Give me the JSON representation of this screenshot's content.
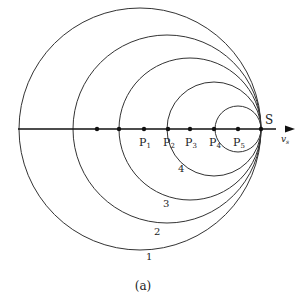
{
  "diagram": {
    "caption": "(a)",
    "source_label": "S",
    "velocity_label": "v",
    "velocity_subscript": "s",
    "axis_y": 129,
    "source_x": 261,
    "circles": [
      {
        "label": "1",
        "cx": 140,
        "r": 121,
        "label_x": 146,
        "label_y": 260
      },
      {
        "label": "2",
        "cx": 167,
        "r": 94,
        "label_x": 154,
        "label_y": 235
      },
      {
        "label": "3",
        "cx": 190,
        "r": 71,
        "label_x": 163,
        "label_y": 207
      },
      {
        "label": "4",
        "cx": 214,
        "r": 47,
        "label_x": 178,
        "label_y": 172
      },
      {
        "label": "5",
        "cx": 238,
        "r": 23
      }
    ],
    "points": [
      {
        "x": 97,
        "label": ""
      },
      {
        "x": 119,
        "label": ""
      },
      {
        "x": 144,
        "label": "P",
        "sub": "1"
      },
      {
        "x": 168,
        "label": "P",
        "sub": "2"
      },
      {
        "x": 190,
        "label": "P",
        "sub": "3"
      },
      {
        "x": 214,
        "label": "P",
        "sub": "4"
      },
      {
        "x": 238,
        "label": "P",
        "sub": "5"
      },
      {
        "x": 261,
        "label": ""
      }
    ]
  }
}
